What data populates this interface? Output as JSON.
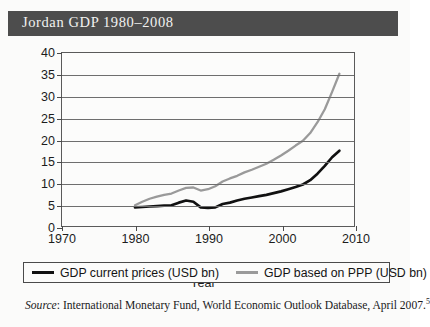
{
  "title": "Jordan GDP 1980–2008",
  "source": {
    "label": "Source",
    "text": ": International Monetary Fund, World Economic Outlook Database, April 2007.",
    "footnote": "5"
  },
  "legend": {
    "items": [
      {
        "label": "GDP current prices (USD bn)",
        "color": "#111111"
      },
      {
        "label": "GDP based on PPP (USD bn)",
        "color": "#9a9a9a"
      }
    ]
  },
  "chart_data": {
    "type": "line",
    "title": "Jordan GDP 1980–2008",
    "xlabel": "Year",
    "ylabel": "",
    "xlim": [
      1970,
      2010
    ],
    "ylim": [
      0,
      40
    ],
    "xticks": [
      1970,
      1980,
      1990,
      2000,
      2010
    ],
    "yticks": [
      0,
      5,
      10,
      15,
      20,
      25,
      30,
      35,
      40
    ],
    "grid": "horizontal",
    "legend_position": "below",
    "x": [
      1980,
      1981,
      1982,
      1983,
      1984,
      1985,
      1986,
      1987,
      1988,
      1989,
      1990,
      1991,
      1992,
      1993,
      1994,
      1995,
      1996,
      1997,
      1998,
      1999,
      2000,
      2001,
      2002,
      2003,
      2004,
      2005,
      2006,
      2007,
      2008
    ],
    "series": [
      {
        "name": "GDP current prices (USD bn)",
        "color": "#111111",
        "values": [
          4.3,
          4.4,
          4.5,
          4.6,
          4.7,
          4.8,
          5.4,
          5.9,
          5.6,
          4.3,
          4.2,
          4.3,
          5.1,
          5.4,
          5.9,
          6.3,
          6.6,
          6.9,
          7.2,
          7.6,
          8.0,
          8.5,
          9.0,
          9.6,
          10.6,
          12.1,
          13.9,
          15.9,
          17.4
        ]
      },
      {
        "name": "GDP based on PPP (USD bn)",
        "color": "#9a9a9a",
        "values": [
          4.8,
          5.6,
          6.3,
          6.8,
          7.2,
          7.5,
          8.2,
          8.8,
          8.9,
          8.2,
          8.5,
          9.2,
          10.3,
          11.0,
          11.6,
          12.4,
          13.0,
          13.7,
          14.4,
          15.3,
          16.3,
          17.4,
          18.6,
          19.7,
          21.5,
          24.0,
          27.0,
          31.0,
          35.2
        ]
      }
    ]
  }
}
